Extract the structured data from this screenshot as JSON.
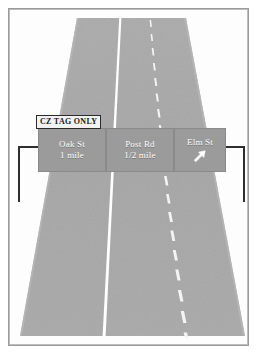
{
  "scene": {
    "title": "Overhead highway guide sign gantry over a three-lane roadway",
    "description": "Perspective view of a roadway with a solid white lane line and a dashed white lane line, spanned by an overhead sign bridge carrying three destination panels and a restriction placard."
  },
  "frame": {
    "name": "picture-frame",
    "border_color": "#9a9a9a",
    "inner_border_color": "#bdbdbd",
    "background_color": "#fdfdfd"
  },
  "roadway": {
    "name": "roadway",
    "surface_color": "#a8a8a8",
    "surface_color_dark": "#9e9e9e",
    "shoulder_color": "#ffffff",
    "top_left_x": 77,
    "top_right_x": 186,
    "bottom_left_x": 20,
    "bottom_right_x": 245,
    "top_y": 18,
    "bottom_y": 336,
    "markings": [
      {
        "name": "solid-lane-line",
        "style": "solid",
        "color": "#ffffff",
        "top_x": 120,
        "bottom_x": 104
      },
      {
        "name": "dashed-lane-line",
        "style": "dashed",
        "color": "#f2f2f2",
        "top_x": 150,
        "bottom_x": 173,
        "dash_length": 7,
        "gap_length": 7
      }
    ]
  },
  "gantry": {
    "name": "sign-gantry",
    "structure_color": "#2e2e2e",
    "left_support": {
      "name": "gantry-support-left",
      "arm_length": 26,
      "post_height": 56
    },
    "right_support": {
      "name": "gantry-support-right",
      "arm_length": 26,
      "post_height": 56
    }
  },
  "placard": {
    "name": "restriction-placard",
    "text": "CZ TAG ONLY",
    "background_color": "#f2f2f2",
    "text_color": "#1d1d1d",
    "border_color": "#2a2a2a"
  },
  "sign": {
    "name": "overhead-guide-sign",
    "panel_color": "#9b9b9b",
    "text_color": "#ffffff",
    "panels": [
      {
        "name": "sign-panel-oak-st",
        "destination": "Oak St",
        "distance": "1 mile",
        "arrow": null
      },
      {
        "name": "sign-panel-post-rd",
        "destination": "Post Rd",
        "distance": "1/2 mile",
        "arrow": null
      },
      {
        "name": "sign-panel-elm-st",
        "destination": "Elm St",
        "distance": "",
        "arrow": "arrow-up-right"
      }
    ]
  }
}
